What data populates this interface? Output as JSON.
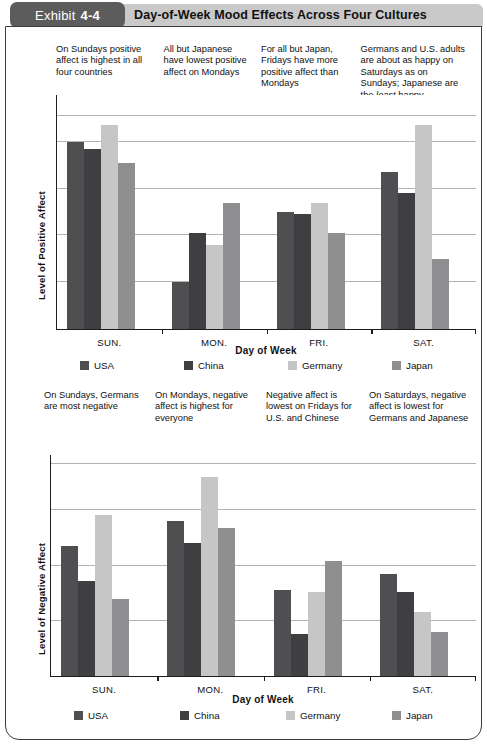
{
  "header": {
    "exhibit_word": "Exhibit",
    "exhibit_number": "4-4",
    "title": "Day-of-Week Mood Effects Across Four Cultures"
  },
  "series_colors": {
    "USA": "#4f4f52",
    "China": "#3f3f42",
    "Germany": "#c6c6c6",
    "Japan": "#8f8f92"
  },
  "legend": {
    "items": [
      {
        "label": "USA",
        "color": "#4f4f52"
      },
      {
        "label": "China",
        "color": "#3f3f42"
      },
      {
        "label": "Germany",
        "color": "#c6c6c6"
      },
      {
        "label": "Japan",
        "color": "#8f8f92"
      }
    ]
  },
  "chart1_notes": [
    {
      "text": "On Sundays positive affect is highest in all four countries"
    },
    {
      "text": "All but Japanese have lowest positive affect on Mondays"
    },
    {
      "text": "For all but Japan, Fridays have more positive affect than Mondays"
    },
    {
      "text": "Germans and U.S. adults are about as happy on Saturdays as on Sundays; Japanese are the ",
      "italic": "least",
      "tail": " happy"
    }
  ],
  "chart2_notes": [
    {
      "text": "On Sundays, Germans are most negative"
    },
    {
      "text": "On Mondays, negative affect is highest for everyone"
    },
    {
      "text": "Negative affect is lowest on Fridays for U.S. and Chinese"
    },
    {
      "text": "On Saturdays, negative affect is lowest for Germans and Japanese"
    }
  ],
  "chart_data": [
    {
      "id": "positive-affect",
      "type": "bar",
      "title": "",
      "xlabel": "Day of Week",
      "ylabel": "Level of Positive Affect",
      "categories": [
        "SUN.",
        "MON.",
        "FRI.",
        "SAT."
      ],
      "ylim": [
        0,
        10
      ],
      "grid": true,
      "gridlines": [
        2,
        4,
        6,
        8,
        9.1
      ],
      "legend_position": "bottom",
      "series": [
        {
          "name": "USA",
          "color": "#4f4f52",
          "values": [
            8.0,
            2.0,
            5.0,
            6.7
          ]
        },
        {
          "name": "China",
          "color": "#3f3f42",
          "values": [
            7.7,
            4.1,
            4.9,
            5.8
          ]
        },
        {
          "name": "Germany",
          "color": "#c6c6c6",
          "values": [
            8.7,
            3.6,
            5.4,
            8.7
          ]
        },
        {
          "name": "Japan",
          "color": "#8f8f92",
          "values": [
            7.1,
            5.4,
            4.1,
            3.0
          ]
        }
      ]
    },
    {
      "id": "negative-affect",
      "type": "bar",
      "title": "",
      "xlabel": "Day of Week",
      "ylabel": "Level of Negative Affect",
      "categories": [
        "SUN.",
        "MON.",
        "FRI.",
        "SAT."
      ],
      "ylim": [
        0,
        10
      ],
      "grid": true,
      "gridlines": [
        2.5,
        5.0,
        7.5,
        9.6
      ],
      "legend_position": "bottom",
      "series": [
        {
          "name": "USA",
          "color": "#4f4f52",
          "values": [
            5.9,
            7.0,
            3.9,
            4.6
          ]
        },
        {
          "name": "China",
          "color": "#3f3f42",
          "values": [
            4.3,
            6.0,
            1.9,
            3.8
          ]
        },
        {
          "name": "Germany",
          "color": "#c6c6c6",
          "values": [
            7.3,
            9.0,
            3.8,
            2.9
          ]
        },
        {
          "name": "Japan",
          "color": "#8f8f92",
          "values": [
            3.5,
            6.7,
            5.2,
            2.0
          ]
        }
      ]
    }
  ]
}
